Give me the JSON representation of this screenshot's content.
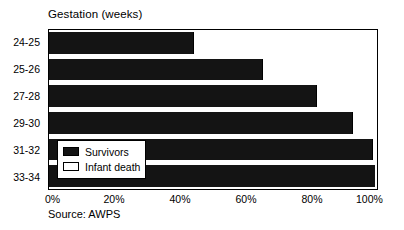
{
  "chart_data": {
    "type": "bar",
    "orientation": "horizontal",
    "stacked": true,
    "title": "Gestation (weeks)",
    "xlabel": "",
    "ylabel": "",
    "categories": [
      "24-25",
      "25-26",
      "27-28",
      "29-30",
      "31-32",
      "33-34"
    ],
    "series": [
      {
        "name": "Survivors",
        "color": "#141414",
        "values": [
          44,
          65,
          81.5,
          92.5,
          98.5,
          99.5
        ]
      },
      {
        "name": "Infant death",
        "color": "#ffffff",
        "values": [
          56,
          35,
          18.5,
          7.5,
          1.5,
          0.5
        ]
      }
    ],
    "xlim": [
      0,
      100
    ],
    "xticks": [
      0,
      20,
      40,
      60,
      80,
      100
    ],
    "xtick_labels": [
      "0%",
      "20%",
      "40%",
      "60%",
      "80%",
      "100%"
    ],
    "grid": false,
    "legend_position": "inside-lower-left",
    "note": "Source: AWPS"
  },
  "legend": {
    "items": [
      {
        "label": "Survivors",
        "swatch": "filled-black"
      },
      {
        "label": "Infant death",
        "swatch": "open-white"
      }
    ]
  },
  "source": {
    "text": "Source: AWPS"
  }
}
